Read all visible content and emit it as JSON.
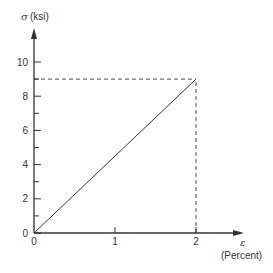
{
  "chart_data": {
    "type": "line",
    "title": "",
    "xlabel_symbol": "ε",
    "xlabel": "(Percent)",
    "ylabel_symbol": "σ",
    "ylabel": "(ksi)",
    "xlim": [
      0,
      2.6
    ],
    "ylim": [
      0,
      11.5
    ],
    "x_ticks": [
      0,
      1,
      2
    ],
    "x_tick_labels": [
      "0",
      "1",
      "2"
    ],
    "y_major_ticks": [
      0,
      2,
      4,
      6,
      8,
      10
    ],
    "y_tick_labels": [
      "0",
      "2",
      "4",
      "6",
      "8",
      "10"
    ],
    "y_minor_ticks": [
      1,
      3,
      5,
      7,
      9
    ],
    "grid": false,
    "legend": "none",
    "series": [
      {
        "name": "stress-strain",
        "style": "solid",
        "x": [
          0,
          2
        ],
        "y": [
          0,
          9
        ]
      }
    ],
    "reference_lines": [
      {
        "name": "horizontal-guide",
        "style": "dashed",
        "x": [
          0,
          2
        ],
        "y": [
          9,
          9
        ]
      },
      {
        "name": "vertical-guide",
        "style": "dashed",
        "x": [
          2,
          2
        ],
        "y": [
          0,
          9
        ]
      }
    ],
    "colors": {
      "ink": "#333333"
    }
  }
}
